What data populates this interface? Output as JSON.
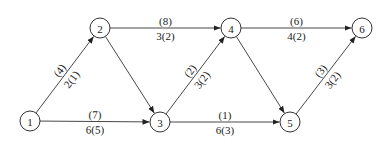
{
  "diagram": {
    "type": "network-flow-graph",
    "nodes": [
      {
        "id": "1",
        "label": "1",
        "x": 30,
        "y": 121
      },
      {
        "id": "2",
        "label": "2",
        "x": 100,
        "y": 28
      },
      {
        "id": "3",
        "label": "3",
        "x": 160,
        "y": 122
      },
      {
        "id": "4",
        "label": "4",
        "x": 231,
        "y": 28
      },
      {
        "id": "5",
        "label": "5",
        "x": 290,
        "y": 122
      },
      {
        "id": "6",
        "label": "6",
        "x": 362,
        "y": 28
      }
    ],
    "edges": [
      {
        "from": "1",
        "to": "2",
        "top": "(4)",
        "bottom": "2(1)"
      },
      {
        "from": "1",
        "to": "3",
        "top": "(7)",
        "bottom": "6(5)"
      },
      {
        "from": "2",
        "to": "3",
        "top": "",
        "bottom": ""
      },
      {
        "from": "2",
        "to": "4",
        "top": "(8)",
        "bottom": "3(2)"
      },
      {
        "from": "3",
        "to": "4",
        "top": "(2)",
        "bottom": "3(2)"
      },
      {
        "from": "3",
        "to": "5",
        "top": "(1)",
        "bottom": "6(3)"
      },
      {
        "from": "4",
        "to": "5",
        "top": "",
        "bottom": ""
      },
      {
        "from": "4",
        "to": "6",
        "top": "(6)",
        "bottom": "4(2)"
      },
      {
        "from": "5",
        "to": "6",
        "top": "(3)",
        "bottom": "3(2)"
      }
    ],
    "node_radius": 10
  }
}
